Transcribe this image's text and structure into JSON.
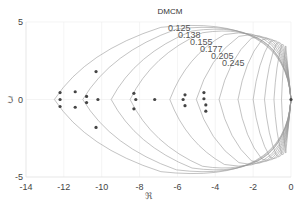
{
  "chart_data": {
    "type": "scatter",
    "title": "DMCM",
    "xlabel": "ℜ",
    "ylabel": "ℑ",
    "xlim": [
      -14,
      0
    ],
    "ylim": [
      -5,
      5
    ],
    "xticks": [
      -14,
      -12,
      -10,
      -8,
      -6,
      -4,
      -2,
      0
    ],
    "yticks": [
      -5,
      0,
      5
    ],
    "grid": true,
    "damping_contours": {
      "labels": [
        "0.125",
        "0.138",
        "0.155",
        "0.177",
        "0.205",
        "0.245"
      ],
      "values": [
        0.125,
        0.138,
        0.155,
        0.177,
        0.205,
        0.245
      ],
      "vertex_x": [
        -12.5,
        -11.0,
        -9.5,
        -8.5,
        -6.4,
        -5.0,
        -3.8,
        -2.8,
        -2.0,
        -1.4,
        -0.9,
        -0.5
      ]
    },
    "series": [
      {
        "name": "poles",
        "x": [
          -12.2,
          -12.2,
          -12.2,
          -11.4,
          -11.4,
          -10.8,
          -10.8,
          -10.3,
          -10.3,
          -10.2,
          -8.3,
          -8.2,
          -8.3,
          -7.2,
          -5.7,
          -5.6,
          -5.6,
          -4.6,
          -4.6,
          -4.5,
          -4.5,
          0
        ],
        "y": [
          0.45,
          0,
          -0.45,
          0.5,
          -0.5,
          0.2,
          -0.2,
          1.8,
          -1.8,
          0,
          0.4,
          0,
          -0.6,
          0,
          0,
          0.3,
          -0.4,
          0.45,
          0.05,
          -0.35,
          -0.75,
          0
        ]
      }
    ]
  }
}
